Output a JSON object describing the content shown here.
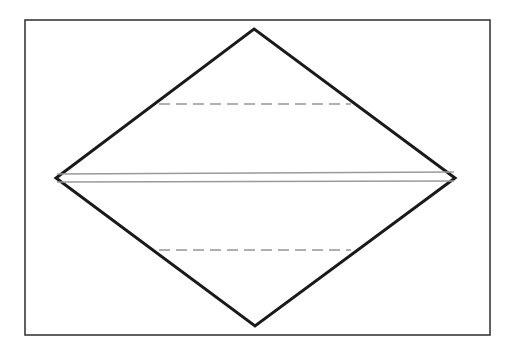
{
  "figure": {
    "canvas": {
      "width": 516,
      "height": 359,
      "background": "#ffffff"
    },
    "colors": {
      "frame_stroke": "#3a3a3a",
      "diamond_stroke": "#1a1a1a",
      "center_line": "#9a9a9a",
      "dashed_line": "#b0b0b0",
      "fill": "#ffffff"
    },
    "frame": {
      "label": "outer-rectangle",
      "x": 25,
      "y": 20,
      "width": 465,
      "height": 315,
      "stroke_width": 1.6
    },
    "diamond": {
      "label": "diamond-outline",
      "stroke_width": 3.0,
      "points": "254,29 455,178 255,326 56,178",
      "vertices": [
        {
          "name": "top-apex",
          "x": 254,
          "y": 29
        },
        {
          "name": "right-apex",
          "x": 455,
          "y": 178
        },
        {
          "name": "bottom-apex",
          "x": 255,
          "y": 326
        },
        {
          "name": "left-apex",
          "x": 56,
          "y": 178
        }
      ]
    },
    "center_lines": [
      {
        "name": "center-line-upper",
        "x1": 57,
        "y1": 174,
        "x2": 454,
        "y2": 172,
        "stroke_width": 1.5
      },
      {
        "name": "center-line-lower",
        "x1": 57,
        "y1": 182,
        "x2": 454,
        "y2": 181,
        "stroke_width": 1.5
      }
    ],
    "dashed_lines": [
      {
        "name": "dashed-line-upper",
        "x1": 159,
        "y1": 104,
        "x2": 351,
        "y2": 104,
        "stroke_width": 1.8,
        "dash": "11 6"
      },
      {
        "name": "dashed-line-lower",
        "x1": 159,
        "y1": 250,
        "x2": 351,
        "y2": 250,
        "stroke_width": 1.8,
        "dash": "11 6"
      }
    ]
  }
}
